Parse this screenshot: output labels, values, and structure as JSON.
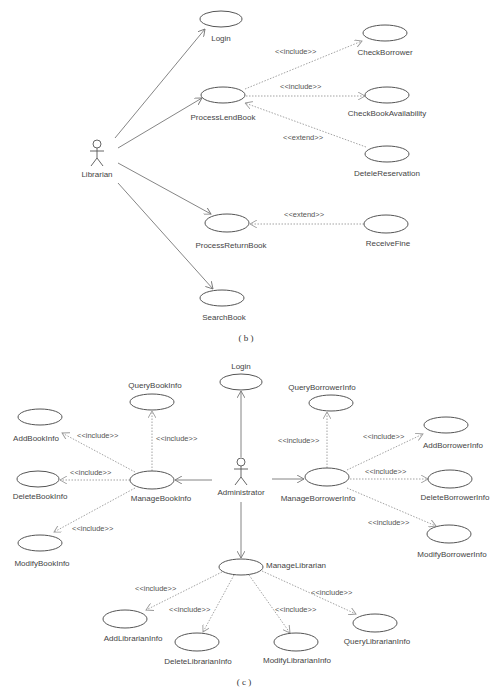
{
  "diagram_b": {
    "caption": "( b )",
    "actor": {
      "name": "Librarian",
      "x": 97,
      "y": 150
    },
    "use_cases": [
      {
        "id": "login",
        "label": "Login",
        "x": 221,
        "y": 19
      },
      {
        "id": "lend",
        "label": "ProcessLendBook",
        "x": 223,
        "y": 95
      },
      {
        "id": "checkborrower",
        "label": "CheckBorrower",
        "x": 385,
        "y": 33
      },
      {
        "id": "checkavail",
        "label": "CheckBookAvailability",
        "x": 387,
        "y": 95
      },
      {
        "id": "delres",
        "label": "DeteleReservation",
        "x": 387,
        "y": 154
      },
      {
        "id": "return",
        "label": "ProcessReturnBook",
        "x": 227,
        "y": 223
      },
      {
        "id": "fine",
        "label": "ReceiveFine",
        "x": 386,
        "y": 224
      },
      {
        "id": "search",
        "label": "SearchBook",
        "x": 222,
        "y": 298
      }
    ],
    "relations": [
      {
        "from": "actor",
        "to": "login",
        "type": "association"
      },
      {
        "from": "actor",
        "to": "lend",
        "type": "association"
      },
      {
        "from": "actor",
        "to": "return",
        "type": "association"
      },
      {
        "from": "actor",
        "to": "search",
        "type": "association"
      },
      {
        "from": "lend",
        "to": "checkborrower",
        "type": "include",
        "label": "<<include>>"
      },
      {
        "from": "lend",
        "to": "checkavail",
        "type": "include",
        "label": "<<include>>"
      },
      {
        "from": "delres",
        "to": "lend",
        "type": "extend",
        "label": "<<extend>>"
      },
      {
        "from": "fine",
        "to": "return",
        "type": "extend",
        "label": "<<extend>>"
      }
    ]
  },
  "diagram_c": {
    "caption": "( c )",
    "actor": {
      "name": "Administrator",
      "x": 241,
      "y": 468
    },
    "use_cases": [
      {
        "id": "login",
        "label": "Login",
        "x": 241,
        "y": 382
      },
      {
        "id": "managebook",
        "label": "ManageBookInfo",
        "x": 152,
        "y": 480
      },
      {
        "id": "querybook",
        "label": "QueryBookInfo",
        "x": 152,
        "y": 402
      },
      {
        "id": "addbook",
        "label": "AddBookInfo",
        "x": 40,
        "y": 417
      },
      {
        "id": "deletebook",
        "label": "DeleteBookInfo",
        "x": 38,
        "y": 479
      },
      {
        "id": "modifybook",
        "label": "ModifyBookInfo",
        "x": 40,
        "y": 543
      },
      {
        "id": "manageborrower",
        "label": "ManageBorrowerInfo",
        "x": 327,
        "y": 477
      },
      {
        "id": "queryborrower",
        "label": "QueryBorrowerInfo",
        "x": 331,
        "y": 403
      },
      {
        "id": "addborrower",
        "label": "AddBorrowerInfo",
        "x": 446,
        "y": 425
      },
      {
        "id": "deleteborrower",
        "label": "DeleteBorrowerInfo",
        "x": 450,
        "y": 479
      },
      {
        "id": "modifyborrower",
        "label": "ModifyBorrowerInfo",
        "x": 449,
        "y": 534
      },
      {
        "id": "managelibrarian",
        "label": "ManageLibrarian",
        "x": 241,
        "y": 567
      },
      {
        "id": "addlibrarian",
        "label": "AddLibrarianInfo",
        "x": 125,
        "y": 619
      },
      {
        "id": "deletelibrarian",
        "label": "DeleteLibrarianInfo",
        "x": 197,
        "y": 642
      },
      {
        "id": "modifylibrarian",
        "label": "ModifyLibrarianInfo",
        "x": 296,
        "y": 642
      },
      {
        "id": "querylibrarian",
        "label": "QueryLibrarianInfo",
        "x": 375,
        "y": 623
      }
    ],
    "relations": [
      {
        "from": "actor",
        "to": "login",
        "type": "association"
      },
      {
        "from": "actor",
        "to": "managebook",
        "type": "association"
      },
      {
        "from": "actor",
        "to": "manageborrower",
        "type": "association"
      },
      {
        "from": "actor",
        "to": "managelibrarian",
        "type": "association"
      },
      {
        "from": "managebook",
        "to": "querybook",
        "type": "include",
        "label": "<<include>>"
      },
      {
        "from": "managebook",
        "to": "addbook",
        "type": "include",
        "label": "<<include>>"
      },
      {
        "from": "managebook",
        "to": "deletebook",
        "type": "include",
        "label": "<<include>>"
      },
      {
        "from": "managebook",
        "to": "modifybook",
        "type": "include",
        "label": "<<include>>"
      },
      {
        "from": "manageborrower",
        "to": "queryborrower",
        "type": "include",
        "label": "<<include>>"
      },
      {
        "from": "manageborrower",
        "to": "addborrower",
        "type": "include",
        "label": "<<include>>"
      },
      {
        "from": "manageborrower",
        "to": "deleteborrower",
        "type": "include",
        "label": "<<include>>"
      },
      {
        "from": "manageborrower",
        "to": "modifyborrower",
        "type": "include",
        "label": "<<include>>"
      },
      {
        "from": "managelibrarian",
        "to": "addlibrarian",
        "type": "include",
        "label": "<<include>>"
      },
      {
        "from": "managelibrarian",
        "to": "deletelibrarian",
        "type": "include",
        "label": "<<include>>"
      },
      {
        "from": "managelibrarian",
        "to": "modifylibrarian",
        "type": "include",
        "label": "<<include>>"
      },
      {
        "from": "managelibrarian",
        "to": "querylibrarian",
        "type": "include",
        "label": "<<include>>"
      }
    ]
  },
  "stereotypes": {
    "include": "<<include>>",
    "extend": "<<extend>>"
  }
}
